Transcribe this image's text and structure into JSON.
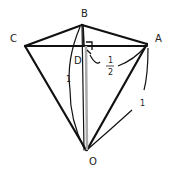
{
  "diagram": {
    "type": "geometry-pyramid",
    "points": {
      "B": "B",
      "C": "C",
      "A": "A",
      "D": "D",
      "O": "O"
    },
    "annotations": {
      "edge_OB": "1",
      "edge_OA": "1",
      "half_num": "1",
      "half_den": "2"
    },
    "colors": {
      "edge": "#111111",
      "altitude": "#aaaaaa"
    }
  }
}
